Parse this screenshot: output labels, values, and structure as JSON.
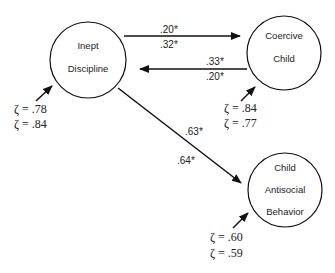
{
  "diagram": {
    "colors": {
      "stroke": "#111111",
      "text": "#222222",
      "background": "#ffffff"
    },
    "nodes": [
      {
        "id": "inept",
        "lines": [
          "Inept",
          "Discipline"
        ],
        "cx": 88,
        "cy": 60,
        "r": 38
      },
      {
        "id": "coercive",
        "lines": [
          "Coercive",
          "Child"
        ],
        "cx": 284,
        "cy": 53,
        "r": 37
      },
      {
        "id": "antisocial",
        "lines": [
          "Child",
          "Antisocial",
          "Behavior"
        ],
        "cx": 285,
        "cy": 190,
        "r": 37
      }
    ],
    "paths": [
      {
        "from": "Inept Discipline",
        "to": "Coercive Child",
        "coefficients": [
          ".20*",
          ".32*"
        ]
      },
      {
        "from": "Coercive Child",
        "to": "Inept Discipline",
        "coefficients": [
          ".33*",
          ".20*"
        ]
      },
      {
        "from": "Inept Discipline",
        "to": "Child Antisocial Behavior",
        "coefficients": [
          ".63*",
          ".64*"
        ]
      }
    ],
    "disturbances": [
      {
        "node": "Inept Discipline",
        "values": [
          "ζ = .78",
          "ζ = .84"
        ]
      },
      {
        "node": "Coercive Child",
        "values": [
          "ζ = .84",
          "ζ = .77"
        ]
      },
      {
        "node": "Child Antisocial Behavior",
        "values": [
          "ζ = .60",
          "ζ = .59"
        ]
      }
    ]
  }
}
